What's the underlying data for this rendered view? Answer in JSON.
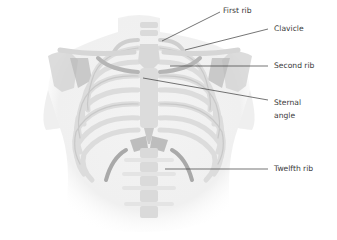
{
  "diagram": {
    "colors": {
      "background": "#ffffff",
      "body_silhouette": "#f1f1f1",
      "bone_light": "#e2e2e2",
      "bone_mid": "#cfcfcf",
      "bone_dark": "#a9a9a9",
      "leader_line": "#3a3a3a",
      "label_text": "#3a3a3a"
    },
    "labels": [
      {
        "id": "first-rib",
        "text": "First rib",
        "x": 223,
        "y": 6,
        "line": [
          162,
          41,
          220,
          12
        ]
      },
      {
        "id": "clavicle",
        "text": "Clavicle",
        "x": 274,
        "y": 24,
        "line": [
          185,
          50,
          268,
          29
        ]
      },
      {
        "id": "second-rib",
        "text": "Second rib",
        "x": 274,
        "y": 61,
        "line": [
          170,
          66,
          268,
          66
        ]
      },
      {
        "id": "sternal-angle",
        "line1": "Sternal",
        "line2": "angle",
        "x": 274,
        "y": 98,
        "line": [
          143,
          78,
          268,
          100
        ]
      },
      {
        "id": "twelfth-rib",
        "text": "Twelfth rib",
        "x": 274,
        "y": 164,
        "line": [
          165,
          169,
          268,
          169
        ]
      }
    ]
  }
}
